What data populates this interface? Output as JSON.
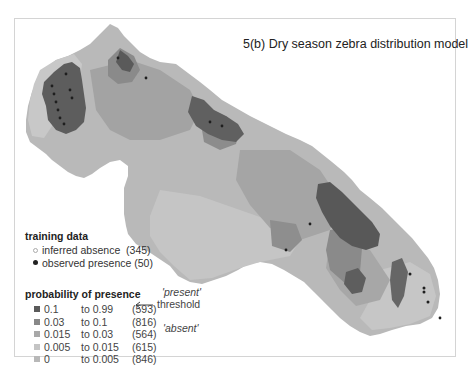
{
  "title": "5(b) Dry season zebra distribution model",
  "legend": {
    "training_data": {
      "header": "training data",
      "items": [
        {
          "label": "inferred absence",
          "count": "(345)",
          "symbol": "open-circle",
          "color": "#aaaaaa"
        },
        {
          "label": "observed presence",
          "count": "(50)",
          "symbol": "filled-circle",
          "color": "#222222"
        }
      ]
    },
    "probability": {
      "header": "probability of presence",
      "classes": [
        {
          "from": "0.1",
          "to": "to 0.99",
          "count": "(593)",
          "color": "#5a5a5a"
        },
        {
          "from": "0.03",
          "to": "to 0.1",
          "count": "(816)",
          "color": "#888888"
        },
        {
          "from": "0.015",
          "to": "to 0.03",
          "count": "(564)",
          "color": "#a8a8a8"
        },
        {
          "from": "0.005",
          "to": "to 0.015",
          "count": "(615)",
          "color": "#c4c4c4"
        },
        {
          "from": "0",
          "to": "to 0.005",
          "count": "(846)",
          "color": "#b8b8b8"
        }
      ],
      "annotations": {
        "present": "'present'",
        "threshold": "threshold",
        "absent": "'absent'"
      }
    }
  }
}
